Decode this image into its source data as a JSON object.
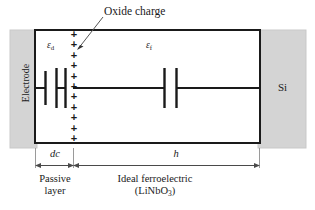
{
  "figure": {
    "title_annotation": "Oxide charge",
    "electrode_label": "Electrode",
    "substrate_label": "Si",
    "permittivity_passive": "ε",
    "permittivity_passive_sub": "d",
    "permittivity_ferro": "ε",
    "permittivity_ferro_sub": "f",
    "dimension_dc": "dc",
    "dimension_h": "h",
    "passive_layer_line1": "Passive",
    "passive_layer_line2": "layer",
    "ferro_line1": "Ideal ferroelectric",
    "ferro_line2_pre": "(LiNbO",
    "ferro_line2_sub": "3",
    "ferro_line2_post": ")",
    "charge_symbol": "+",
    "charge_count": 11,
    "colors": {
      "background": "#ffffff",
      "line": "#1a1a1a",
      "gray_region": "#d4d4d4",
      "gray_region_stroke": "#c0c0c0",
      "thin_line": "#808080"
    },
    "geometry": {
      "box_left": 35,
      "box_right": 260,
      "box_top": 30,
      "box_bottom": 143,
      "interface_x": 73,
      "wire_y": 88
    }
  }
}
